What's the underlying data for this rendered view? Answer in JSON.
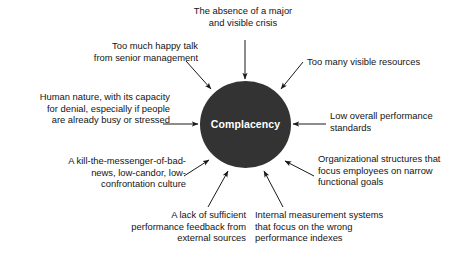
{
  "diagram": {
    "type": "radial-cause-diagram",
    "hub": {
      "label": "Complacency",
      "shape": "circle",
      "fill_color": "#333333",
      "text_color": "#ffffff",
      "center": [
        245,
        125
      ],
      "radius": 45
    },
    "background_color": "#ffffff",
    "arrow_color": "#1a1a1a",
    "causes": [
      {
        "id": "absence-of-crisis",
        "text": "The absence of a major\nand visible crisis",
        "align": "center",
        "arrow": "down"
      },
      {
        "id": "happy-talk",
        "text": "Too much happy talk\nfrom senior management",
        "align": "right",
        "arrow": "down-right"
      },
      {
        "id": "visible-resources",
        "text": "Too many visible resources",
        "align": "left",
        "arrow": "down-left"
      },
      {
        "id": "human-nature",
        "text": "Human nature, with its capacity\nfor denial, especially if people\nare already busy or stressed",
        "align": "right",
        "arrow": "right"
      },
      {
        "id": "low-performance-standards",
        "text": "Low overall performance\nstandards",
        "align": "left",
        "arrow": "left"
      },
      {
        "id": "kill-the-messenger-culture",
        "text": "A kill-the-messenger-of-bad-\nnews, low-candor, low-\nconfrontation culture",
        "align": "right",
        "arrow": "up-right"
      },
      {
        "id": "organizational-structures",
        "text": "Organizational structures that\nfocus employees on narrow\nfunctional goals",
        "align": "left",
        "arrow": "up-left"
      },
      {
        "id": "lack-of-feedback",
        "text": "A lack of sufficient\nperformance feedback from\nexternal sources",
        "align": "right",
        "arrow": "up-right"
      },
      {
        "id": "internal-measurement",
        "text": "Internal measurement systems\nthat focus on the wrong\nperformance indexes",
        "align": "left",
        "arrow": "up-left"
      }
    ]
  }
}
